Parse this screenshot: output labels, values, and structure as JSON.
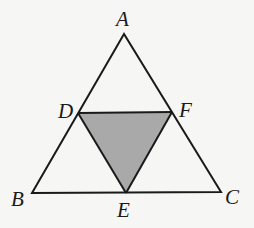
{
  "diagram": {
    "colors": {
      "background": "#f6f6f4",
      "stroke": "#1a1a1a",
      "shade": "#a9a9a9"
    },
    "points": {
      "A": {
        "label": "A",
        "x": 124,
        "y": 34
      },
      "B": {
        "label": "B",
        "x": 32,
        "y": 193
      },
      "C": {
        "label": "C",
        "x": 221,
        "y": 192
      },
      "D": {
        "label": "D",
        "x": 78,
        "y": 113
      },
      "E": {
        "label": "E",
        "x": 126,
        "y": 193
      },
      "F": {
        "label": "F",
        "x": 172,
        "y": 112
      }
    },
    "shaded_region": [
      "D",
      "E",
      "F"
    ]
  }
}
